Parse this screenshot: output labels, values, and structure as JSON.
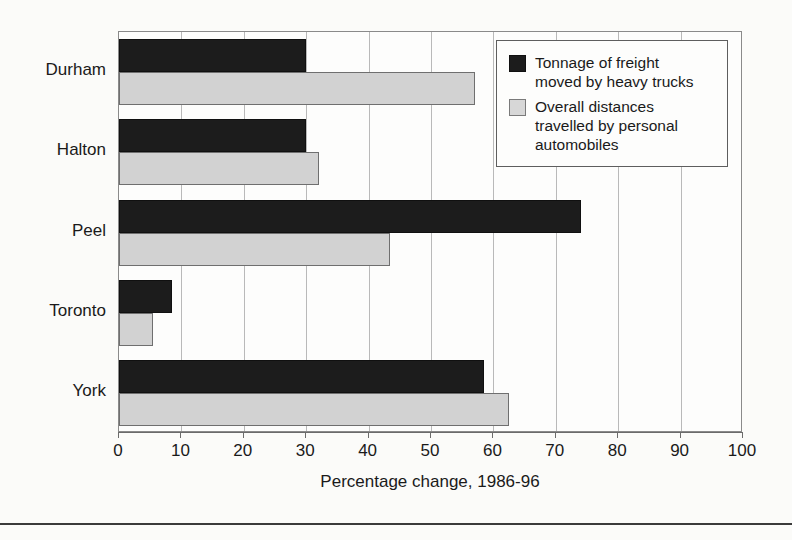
{
  "chart_data": {
    "type": "bar",
    "orientation": "horizontal",
    "title": "",
    "xlabel": "Percentage change, 1986-96",
    "ylabel": "",
    "xlim": [
      0,
      100
    ],
    "xticks": [
      "0",
      "10",
      "20",
      "30",
      "40",
      "50",
      "60",
      "70",
      "80",
      "90",
      "100"
    ],
    "grid": true,
    "legend_position": "top-right",
    "categories": [
      "Durham",
      "Halton",
      "Peel",
      "Toronto",
      "York"
    ],
    "series": [
      {
        "name": "Tonnage of freight moved by heavy trucks",
        "color": "#1c1c1c",
        "values": [
          30,
          30,
          74,
          8.5,
          58.5
        ]
      },
      {
        "name": "Overall distances travelled by personal automobiles",
        "color": "#d2d2d2",
        "values": [
          57,
          32,
          43.5,
          5.5,
          62.5
        ]
      }
    ]
  },
  "legend": {
    "items": [
      {
        "swatch": "dark-square-swatch",
        "label": "Tonnage of freight\nmoved by heavy trucks"
      },
      {
        "swatch": "light-square-swatch",
        "label": "Overall distances\ntravelled by personal\nautomobiles"
      }
    ]
  }
}
